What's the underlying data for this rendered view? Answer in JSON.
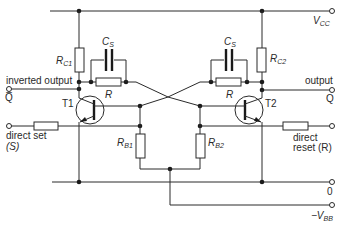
{
  "diagram": {
    "type": "circuit-schematic",
    "rails": {
      "vcc": {
        "label": "V",
        "sub": "CC"
      },
      "zero": {
        "label": "0"
      },
      "vbb": {
        "label": "−V",
        "sub": "BB"
      }
    },
    "transistors": [
      {
        "id": "T1",
        "label": "T1"
      },
      {
        "id": "T2",
        "label": "T2"
      }
    ],
    "resistors": {
      "rc1": {
        "label": "R",
        "sub": "C1"
      },
      "rc2": {
        "label": "R",
        "sub": "C2"
      },
      "r_left": {
        "label": "R"
      },
      "r_right": {
        "label": "R"
      },
      "rb1": {
        "label": "R",
        "sub": "B1"
      },
      "rb2": {
        "label": "R",
        "sub": "B2"
      }
    },
    "capacitors": {
      "cs_left": {
        "label": "C",
        "sub": "S"
      },
      "cs_right": {
        "label": "C",
        "sub": "S"
      }
    },
    "terminals": {
      "inverted_output": {
        "label": "inverted output",
        "symbol": "Q̅"
      },
      "output": {
        "label": "output",
        "symbol": "Q"
      },
      "direct_set": {
        "label": "direct set",
        "symbol": "(S)"
      },
      "direct_reset": {
        "label_line1": "direct",
        "label_line2": "reset (R)"
      }
    }
  }
}
